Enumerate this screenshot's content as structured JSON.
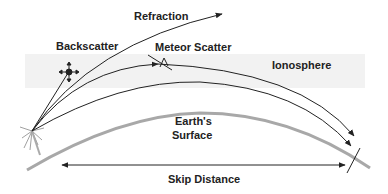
{
  "diagram": {
    "labels": {
      "refraction": "Refraction",
      "backscatter": "Backscatter",
      "meteor_scatter": "Meteor Scatter",
      "ionosphere": "Ionosphere",
      "earth_line1": "Earth's",
      "earth_line2": "Surface",
      "skip_distance": "Skip Distance"
    },
    "colors": {
      "ionosphere_band": "#f2f2f2",
      "earth_surface": "#a8a8a8",
      "ray": "#222222",
      "text": "#222222"
    },
    "icons": [
      "backscatter-node-icon",
      "meteor-icon",
      "transmitter-burst-icon",
      "skip-end-tick-icon"
    ]
  }
}
